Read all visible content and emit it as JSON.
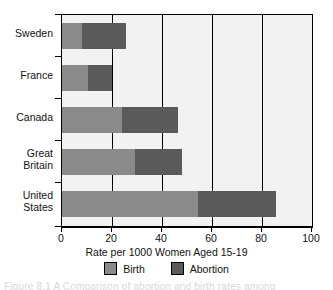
{
  "chart_data": {
    "type": "bar",
    "orientation": "horizontal",
    "stacked": true,
    "title": "",
    "xlabel": "Rate per 1000 Women Aged 15-19",
    "ylabel": "",
    "xlim": [
      0,
      100
    ],
    "xticks": [
      0,
      20,
      40,
      60,
      80,
      100
    ],
    "xtick_labels": [
      "0",
      "20",
      "40",
      "60",
      "80",
      "100"
    ],
    "grid": true,
    "grid_axis": "x",
    "legend_position": "bottom",
    "categories": [
      "Sweden",
      "France",
      "Canada",
      "Great\nBritain",
      "United\nStates"
    ],
    "series": [
      {
        "name": "Birth",
        "color": "#8a8a8a",
        "values": [
          8,
          10.5,
          24,
          29,
          54.5
        ]
      },
      {
        "name": "Abortion",
        "color": "#5a5a5a",
        "values": [
          17.5,
          9.5,
          22.5,
          19,
          31
        ]
      }
    ],
    "totals": [
      25.5,
      20,
      46.5,
      48,
      85.5
    ]
  },
  "legend": {
    "items": [
      {
        "label": "Birth",
        "color": "#8a8a8a"
      },
      {
        "label": "Abortion",
        "color": "#5a5a5a"
      }
    ]
  },
  "caption_sliver": "Figure 8.1  A  Comparison of abortion and birth rates among"
}
